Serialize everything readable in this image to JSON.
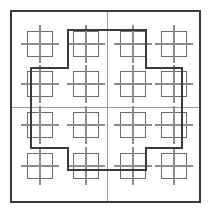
{
  "figure": {
    "canvas": {
      "width": 211,
      "height": 213,
      "background": "#ffffff"
    },
    "colors": {
      "outer_border": "#3a3a3a",
      "thick_outline": "#3a3a3a",
      "thin_cross": "#9a9a9a",
      "motif_square": "#6b6b6b",
      "motif_cross": "#8c8c8c"
    },
    "stroke_widths": {
      "outer_border": 1.6,
      "thick_outline": 1.8,
      "thin_cross": 1.0,
      "motif_square": 1.2,
      "motif_cross": 1.2
    },
    "outer_border": {
      "x": 11,
      "y": 11,
      "width": 189,
      "height": 191
    },
    "thin_cross": {
      "vertical_x": 107,
      "horizontal_y": 107
    },
    "thick_outline": {
      "shape": "plus",
      "points": "68,30 146,30 146,68 182,68 182,148 146,148 146,170 68,170 68,148 31,148 31,68 68,68"
    },
    "motif": {
      "square_size": 25,
      "cross_extent": 19,
      "label": "crossed-square"
    },
    "motif_centers_x": [
      40,
      86,
      133,
      174
    ],
    "motif_centers_y": [
      44,
      84,
      125,
      166
    ],
    "motifs": [
      {
        "row": 0,
        "col": 0,
        "cx": 40,
        "cy": 44
      },
      {
        "row": 0,
        "col": 1,
        "cx": 86,
        "cy": 44
      },
      {
        "row": 0,
        "col": 2,
        "cx": 133,
        "cy": 44
      },
      {
        "row": 0,
        "col": 3,
        "cx": 174,
        "cy": 44
      },
      {
        "row": 1,
        "col": 0,
        "cx": 40,
        "cy": 84
      },
      {
        "row": 1,
        "col": 1,
        "cx": 86,
        "cy": 84
      },
      {
        "row": 1,
        "col": 2,
        "cx": 133,
        "cy": 84
      },
      {
        "row": 1,
        "col": 3,
        "cx": 174,
        "cy": 84
      },
      {
        "row": 2,
        "col": 0,
        "cx": 40,
        "cy": 125
      },
      {
        "row": 2,
        "col": 1,
        "cx": 86,
        "cy": 125
      },
      {
        "row": 2,
        "col": 2,
        "cx": 133,
        "cy": 125
      },
      {
        "row": 2,
        "col": 3,
        "cx": 174,
        "cy": 125
      },
      {
        "row": 3,
        "col": 0,
        "cx": 40,
        "cy": 166
      },
      {
        "row": 3,
        "col": 1,
        "cx": 86,
        "cy": 166
      },
      {
        "row": 3,
        "col": 2,
        "cx": 133,
        "cy": 166
      },
      {
        "row": 3,
        "col": 3,
        "cx": 174,
        "cy": 166
      }
    ]
  }
}
